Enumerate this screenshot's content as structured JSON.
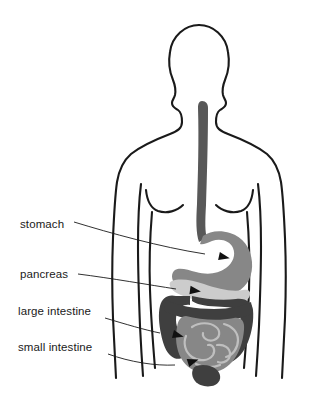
{
  "diagram": {
    "background_color": "#ffffff",
    "outline_color": "#1a1a1a",
    "colors": {
      "esophagus": "#585858",
      "stomach": "#878787",
      "pancreas": "#cccccc",
      "large_intestine": "#3f3f3f",
      "small_intestine": "#878787",
      "small_intestine_loops": "#b9b9b9",
      "rectum": "#3f3f3f",
      "leader_line": "#1a1a1a",
      "body_outline": "#1a1a1a"
    },
    "labels": [
      {
        "id": "stomach",
        "text": "stomach",
        "x": 20,
        "y": 228,
        "organ": "stomach",
        "leader": "M 74 222 C 110 233, 160 247, 205 254",
        "arrow_x": 219,
        "arrow_y": 256,
        "arrow_angle": 12
      },
      {
        "id": "pancreas",
        "text": "pancreas",
        "x": 20,
        "y": 278,
        "organ": "pancreas",
        "leader": "M 78 274 C 110 278, 150 285, 176 289",
        "arrow_x": 190,
        "arrow_y": 290,
        "arrow_angle": 8
      },
      {
        "id": "large-intestine",
        "text": "large intestine",
        "x": 18,
        "y": 315,
        "organ": "large_intestine",
        "leader": "M 105 318 C 125 324, 145 330, 160 333",
        "arrow_x": 173,
        "arrow_y": 334,
        "arrow_angle": 14
      },
      {
        "id": "small-intestine",
        "text": "small intestine",
        "x": 18,
        "y": 351,
        "organ": "small_intestine",
        "leader": "M 108 354 C 130 362, 155 366, 175 365",
        "arrow_x": 188,
        "arrow_y": 363,
        "arrow_angle": -18
      }
    ],
    "organs": [
      {
        "id": "esophagus",
        "name": "esophagus",
        "labeled": false
      },
      {
        "id": "stomach",
        "name": "stomach",
        "labeled": true
      },
      {
        "id": "pancreas",
        "name": "pancreas",
        "labeled": true
      },
      {
        "id": "large-intestine",
        "name": "large intestine",
        "labeled": true
      },
      {
        "id": "small-intestine",
        "name": "small intestine",
        "labeled": true
      },
      {
        "id": "rectum",
        "name": "rectum",
        "labeled": false
      }
    ]
  }
}
